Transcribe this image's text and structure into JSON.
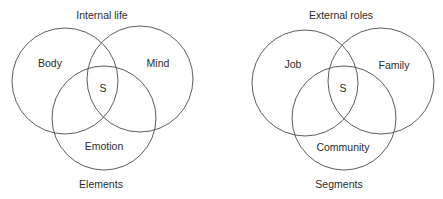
{
  "diagrams": [
    {
      "title": "Internal life",
      "footer": "Elements",
      "center": "S",
      "sets": [
        {
          "label": "Body",
          "cx": 65,
          "cy": 81,
          "r": 53,
          "lx": 50,
          "ly": 67
        },
        {
          "label": "Mind",
          "cx": 140,
          "cy": 79,
          "r": 53,
          "lx": 158,
          "ly": 67
        },
        {
          "label": "Emotion",
          "cx": 104,
          "cy": 118,
          "r": 52,
          "lx": 104,
          "ly": 150
        }
      ],
      "title_pos": {
        "x": 102,
        "y": 19
      },
      "center_pos": {
        "x": 103,
        "y": 92
      },
      "footer_pos": {
        "x": 101,
        "y": 188
      }
    },
    {
      "title": "External roles",
      "footer": "Segments",
      "center": "S",
      "sets": [
        {
          "label": "Job",
          "cx": 305,
          "cy": 83,
          "r": 53,
          "lx": 293,
          "ly": 68
        },
        {
          "label": "Family",
          "cx": 381,
          "cy": 81,
          "r": 53,
          "lx": 394,
          "ly": 69
        },
        {
          "label": "Community",
          "cx": 344,
          "cy": 118,
          "r": 52,
          "lx": 343,
          "ly": 151
        }
      ],
      "title_pos": {
        "x": 341,
        "y": 19
      },
      "center_pos": {
        "x": 343,
        "y": 92
      },
      "footer_pos": {
        "x": 339,
        "y": 188
      }
    }
  ],
  "colors": {
    "stroke": "#4a4a4a",
    "text": "#2b2b2b",
    "background": "#ffffff"
  }
}
